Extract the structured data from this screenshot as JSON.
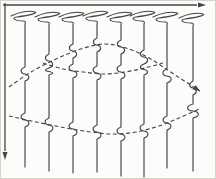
{
  "figure": {
    "kind": "hand-drawn-seismic-wiggle-section",
    "width": 216,
    "height": 179,
    "background_color": "#fcfcfa",
    "frame_border_color": "#d4d4cc",
    "stroke_color": "#454545",
    "dash_pattern": "4 2.6"
  },
  "axes": {
    "x_axis": {
      "y": 4,
      "x1": 2,
      "x2": 196,
      "arrow_tip_x": 205,
      "direction": "right"
    },
    "y_axis": {
      "x": 4,
      "y1": 2,
      "y2": 150,
      "arrow_tip_y": 159,
      "direction": "down"
    }
  },
  "traces": [
    {
      "x": 24,
      "top": 10,
      "bottom": 166,
      "wiggles": [
        [
          73,
          4.2
        ],
        [
          119,
          4.2
        ]
      ]
    },
    {
      "x": 48,
      "top": 11,
      "bottom": 170,
      "wiggles": [
        [
          60,
          3.8
        ],
        [
          67,
          3.8
        ],
        [
          124,
          4.2
        ]
      ]
    },
    {
      "x": 72,
      "top": 11,
      "bottom": 172,
      "wiggles": [
        [
          50,
          3.8
        ],
        [
          70,
          4.2
        ],
        [
          128,
          4.2
        ]
      ]
    },
    {
      "x": 96,
      "top": 10,
      "bottom": 171,
      "wiggles": [
        [
          44,
          3.8
        ],
        [
          72,
          4.2
        ],
        [
          131,
          4.2
        ]
      ]
    },
    {
      "x": 120,
      "top": 11,
      "bottom": 175,
      "wiggles": [
        [
          46,
          3.8
        ],
        [
          71,
          4.2
        ],
        [
          133,
          4.2
        ]
      ]
    },
    {
      "x": 143,
      "top": 10,
      "bottom": 176,
      "wiggles": [
        [
          56,
          3.8
        ],
        [
          67,
          3.8
        ],
        [
          130,
          4.2
        ]
      ]
    },
    {
      "x": 166,
      "top": 11,
      "bottom": 167,
      "wiggles": [
        [
          75,
          4.5
        ],
        [
          122,
          4.2
        ]
      ]
    },
    {
      "x": 192,
      "top": 12,
      "bottom": 170,
      "wiggles": [
        [
          87,
          3.4
        ],
        [
          110,
          6.2
        ]
      ]
    }
  ],
  "event_curves": [
    {
      "name": "upper-event",
      "arrow_end": true,
      "points": [
        [
          8,
          86
        ],
        [
          30,
          71
        ],
        [
          55,
          58
        ],
        [
          80,
          48
        ],
        [
          103,
          43
        ],
        [
          125,
          47
        ],
        [
          148,
          57
        ],
        [
          168,
          70
        ],
        [
          185,
          81
        ],
        [
          199,
          90
        ]
      ]
    },
    {
      "name": "inner-event",
      "arrow_end": false,
      "points": [
        [
          42,
          62
        ],
        [
          62,
          68
        ],
        [
          82,
          71
        ],
        [
          103,
          73
        ],
        [
          124,
          71
        ],
        [
          144,
          67
        ],
        [
          162,
          62
        ]
      ]
    },
    {
      "name": "lower-event",
      "arrow_end": false,
      "points": [
        [
          8,
          115
        ],
        [
          35,
          121
        ],
        [
          65,
          127
        ],
        [
          90,
          131
        ],
        [
          112,
          133
        ],
        [
          135,
          131
        ],
        [
          158,
          125
        ],
        [
          178,
          117
        ],
        [
          198,
          108
        ]
      ]
    }
  ]
}
